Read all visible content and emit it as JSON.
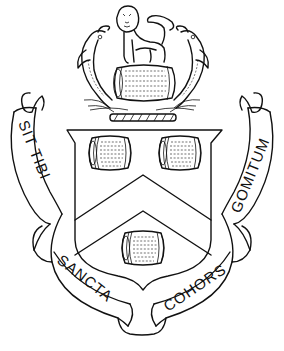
{
  "image": {
    "description": "Heraldic coat of arms line drawing",
    "colors": {
      "ink": "#111111",
      "background": "#ffffff"
    }
  },
  "crest": {
    "figure": "lion standing on a barrel",
    "supporters_crest": "two dolphins",
    "wreath": "torse"
  },
  "shield": {
    "ordinary": "chevron",
    "charges": [
      "barrel",
      "barrel",
      "barrel"
    ]
  },
  "motto": {
    "left": "SIT TIBI",
    "right": "GOMITUM",
    "bottom_left": "SANCTA",
    "bottom_right": "COHORS"
  }
}
